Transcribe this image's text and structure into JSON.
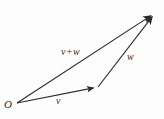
{
  "figure": {
    "kind": "vector-addition-diagram",
    "background_color": "#fdfdfd",
    "stroke_color": "#2b2b2b",
    "width": 164,
    "height": 119,
    "labels": {
      "origin": "O",
      "v": "v",
      "w": "w",
      "sum": "v + w",
      "sum_left": "v",
      "sum_operator": "+",
      "sum_right": "w"
    },
    "points": {
      "origin": {
        "x": 17,
        "y": 103
      },
      "v_tip": {
        "x": 98,
        "y": 87
      },
      "sum_tip": {
        "x": 155,
        "y": 13
      }
    },
    "arrows": [
      {
        "name": "vector-v",
        "label": "v",
        "from": {
          "x": 17,
          "y": 103
        },
        "to": {
          "x": 98,
          "y": 87
        }
      },
      {
        "name": "vector-w",
        "label": "w",
        "from": {
          "x": 98,
          "y": 87
        },
        "to": {
          "x": 155,
          "y": 13
        }
      },
      {
        "name": "vector-v-plus-w",
        "label": "v + w",
        "from": {
          "x": 17,
          "y": 103
        },
        "to": {
          "x": 155,
          "y": 13
        }
      }
    ]
  }
}
